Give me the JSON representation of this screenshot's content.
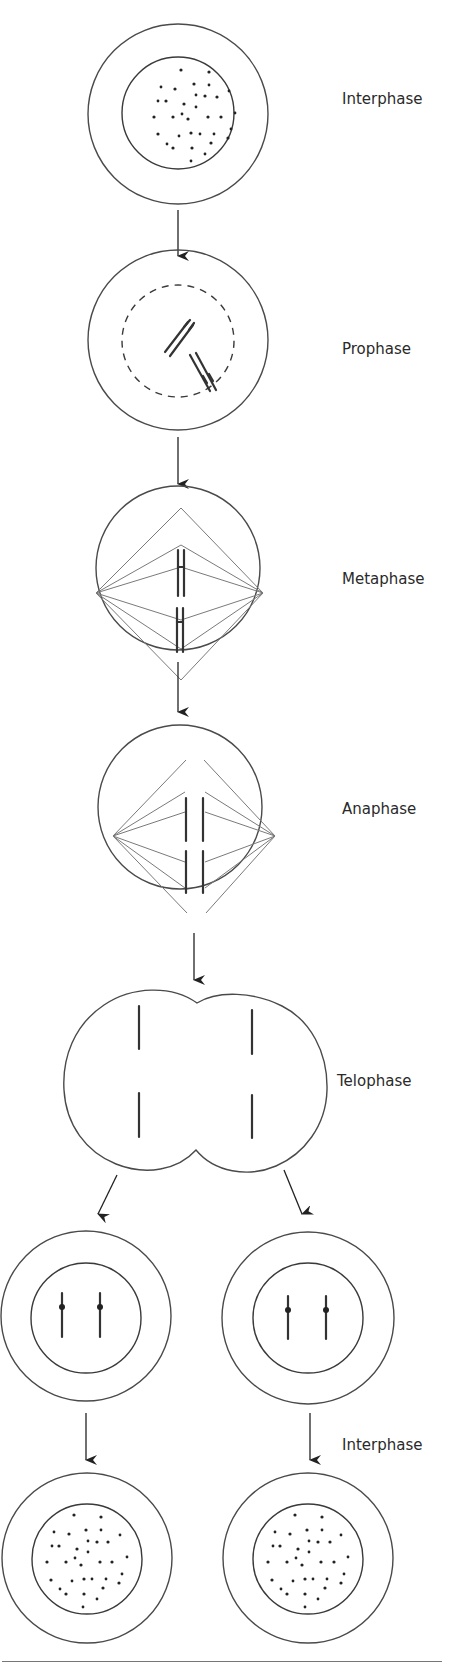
{
  "diagram": {
    "type": "process-flow",
    "stages": [
      {
        "id": "interphase-1",
        "label": "Interphase",
        "content": "cell with nucleus containing scattered chromatin dots"
      },
      {
        "id": "prophase",
        "label": "Prophase",
        "content": "dashed nuclear envelope with two condensed paired chromosomes"
      },
      {
        "id": "metaphase",
        "label": "Metaphase",
        "content": "spindle fibres from two poles, paired chromosomes aligned at equator"
      },
      {
        "id": "anaphase",
        "label": "Anaphase",
        "content": "spindle fibres pulling separated chromatids toward poles"
      },
      {
        "id": "telophase",
        "label": "Telophase",
        "content": "dividing cell with cleavage furrow, two chromatid sets"
      },
      {
        "id": "daughter-cells",
        "label": "",
        "content": "two daughter cells each with nucleus and two chromosomes"
      },
      {
        "id": "interphase-2",
        "label": "Interphase",
        "content": "two daughter cells with scattered chromatin"
      }
    ],
    "edges": [
      {
        "from": "interphase-1",
        "to": "prophase"
      },
      {
        "from": "prophase",
        "to": "metaphase"
      },
      {
        "from": "metaphase",
        "to": "anaphase"
      },
      {
        "from": "anaphase",
        "to": "telophase"
      },
      {
        "from": "telophase",
        "to": "daughter-cell-left"
      },
      {
        "from": "telophase",
        "to": "daughter-cell-right"
      },
      {
        "from": "daughter-cell-left",
        "to": "interphase-cell-left"
      },
      {
        "from": "daughter-cell-right",
        "to": "interphase-cell-right"
      }
    ]
  },
  "labels": {
    "interphase_top": "Interphase",
    "prophase": "Prophase",
    "metaphase": "Metaphase",
    "anaphase": "Anaphase",
    "telophase": "Telophase",
    "interphase_bottom": "Interphase"
  },
  "caption": {
    "text": ""
  }
}
